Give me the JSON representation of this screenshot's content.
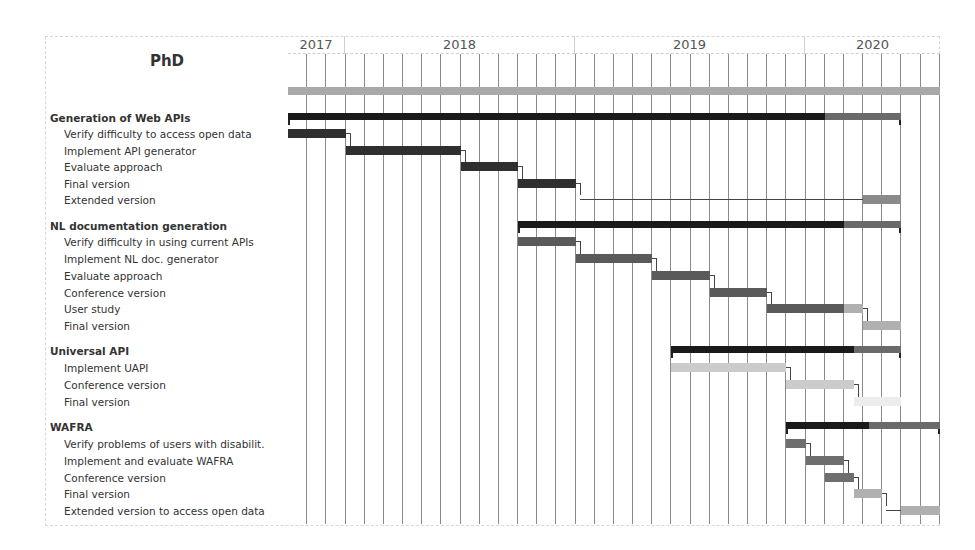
{
  "chart_data": {
    "type": "gantt",
    "title": "PhD",
    "timeline": {
      "start": "2017-10",
      "end": "2020-08",
      "unit": "month",
      "years": [
        {
          "label": "2017",
          "start_month": 0,
          "months": 3
        },
        {
          "label": "2018",
          "start_month": 3,
          "months": 12
        },
        {
          "label": "2019",
          "start_month": 15,
          "months": 12
        },
        {
          "label": "2020",
          "start_month": 27,
          "months": 7
        }
      ]
    },
    "colors": {
      "phd": "#a9a9a9",
      "summary_done": "#1a1a1a",
      "summary_todo": "#6a6a6a",
      "group1": "#2f2f2f",
      "group2": "#5a5a5a",
      "group3": "#c4c4c4",
      "group4": "#6e6e6e",
      "light": "#b0b0b0",
      "pale": "#e2e2e2",
      "grid": "#8a8a8a"
    },
    "phd_bar": {
      "start": 0,
      "end": 34
    },
    "groups": [
      {
        "label": "Generation of Web APIs",
        "summary": {
          "start": 0,
          "end": 32,
          "progress_end": 28
        },
        "tasks": [
          {
            "label": "Verify difficulty to access open data",
            "start": 0,
            "end": 3,
            "color": "#2f2f2f"
          },
          {
            "label": "Implement API generator",
            "start": 3,
            "end": 9,
            "color": "#2f2f2f"
          },
          {
            "label": "Evaluate approach",
            "start": 9,
            "end": 12,
            "color": "#2f2f2f"
          },
          {
            "label": "Final version",
            "start": 12,
            "end": 15,
            "color": "#2f2f2f"
          },
          {
            "label": "Extended version",
            "start": 30,
            "end": 32,
            "color": "#8a8a8a"
          }
        ]
      },
      {
        "label": "NL documentation generation",
        "summary": {
          "start": 12,
          "end": 32,
          "progress_end": 29
        },
        "tasks": [
          {
            "label": "Verify difficulty in using current APIs",
            "start": 12,
            "end": 15,
            "color": "#5a5a5a"
          },
          {
            "label": "Implement NL doc. generator",
            "start": 15,
            "end": 19,
            "color": "#5a5a5a"
          },
          {
            "label": "Evaluate approach",
            "start": 19,
            "end": 22,
            "color": "#5a5a5a"
          },
          {
            "label": "Conference version",
            "start": 22,
            "end": 25,
            "color": "#5a5a5a"
          },
          {
            "label": "User study",
            "start": 25,
            "end": 30,
            "color": "#5a5a5a",
            "progress_end": 29
          },
          {
            "label": "Final version",
            "start": 30,
            "end": 32,
            "color": "#b0b0b0"
          }
        ]
      },
      {
        "label": "Universal API",
        "summary": {
          "start": 20,
          "end": 32,
          "progress_end": 29.5
        },
        "tasks": [
          {
            "label": "Implement UAPI",
            "start": 20,
            "end": 26,
            "color": "#cbcbcb"
          },
          {
            "label": "Conference version",
            "start": 26,
            "end": 29.5,
            "color": "#cbcbcb"
          },
          {
            "label": "Final version",
            "start": 29.5,
            "end": 32,
            "color": "#ececec"
          }
        ]
      },
      {
        "label": "WAFRA",
        "summary": {
          "start": 26,
          "end": 34,
          "progress_end": 30.3
        },
        "tasks": [
          {
            "label": "Verify problems of users with disabilit.",
            "start": 26,
            "end": 27,
            "color": "#6e6e6e"
          },
          {
            "label": "Implement and evaluate WAFRA",
            "start": 27,
            "end": 29,
            "color": "#6e6e6e"
          },
          {
            "label": "Conference version",
            "start": 28,
            "end": 29.5,
            "color": "#6e6e6e"
          },
          {
            "label": "Final version",
            "start": 29.5,
            "end": 31,
            "color": "#b0b0b0"
          },
          {
            "label": "Extended version to access open data",
            "start": 32,
            "end": 34,
            "color": "#b0b0b0"
          }
        ]
      }
    ]
  },
  "labels": {
    "title": "PhD",
    "g0": "Generation of Web APIs",
    "g0t0": "Verify difficulty to access open data",
    "g0t1": "Implement API generator",
    "g0t2": "Evaluate approach",
    "g0t3": "Final version",
    "g0t4": "Extended version",
    "g1": "NL documentation generation",
    "g1t0": "Verify difficulty in using current APIs",
    "g1t1": "Implement NL doc. generator",
    "g1t2": "Evaluate approach",
    "g1t3": "Conference version",
    "g1t4": "User study",
    "g1t5": "Final version",
    "g2": "Universal API",
    "g2t0": "Implement UAPI",
    "g2t1": "Conference version",
    "g2t2": "Final version",
    "g3": "WAFRA",
    "g3t0": "Verify problems of users with disabilit.",
    "g3t1": "Implement and evaluate WAFRA",
    "g3t2": "Conference version",
    "g3t3": "Final version",
    "g3t4": "Extended version to access open data",
    "y2017": "2017",
    "y2018": "2018",
    "y2019": "2019",
    "y2020": "2020"
  }
}
